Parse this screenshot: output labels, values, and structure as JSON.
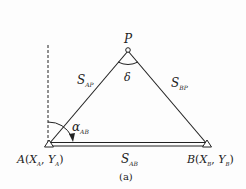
{
  "figure": {
    "caption": "(a)",
    "points": {
      "A": {
        "label": "A",
        "coord_open": "(",
        "x_var": "X",
        "x_sub": "A",
        "sep": ", ",
        "y_var": "Y",
        "y_sub": "A",
        "coord_close": ")"
      },
      "B": {
        "label": "B",
        "coord_open": "(",
        "x_var": "X",
        "x_sub": "B",
        "sep": ", ",
        "y_var": "Y",
        "y_sub": "B",
        "coord_close": ")"
      },
      "P": {
        "label": "P"
      }
    },
    "sides": {
      "AP": {
        "var": "S",
        "sub": "AP"
      },
      "BP": {
        "var": "S",
        "sub": "BP"
      },
      "AB": {
        "var": "S",
        "sub": "AB"
      }
    },
    "angles": {
      "delta": {
        "symbol": "δ"
      },
      "azimuth": {
        "var": "α",
        "sub": "AB"
      }
    }
  }
}
